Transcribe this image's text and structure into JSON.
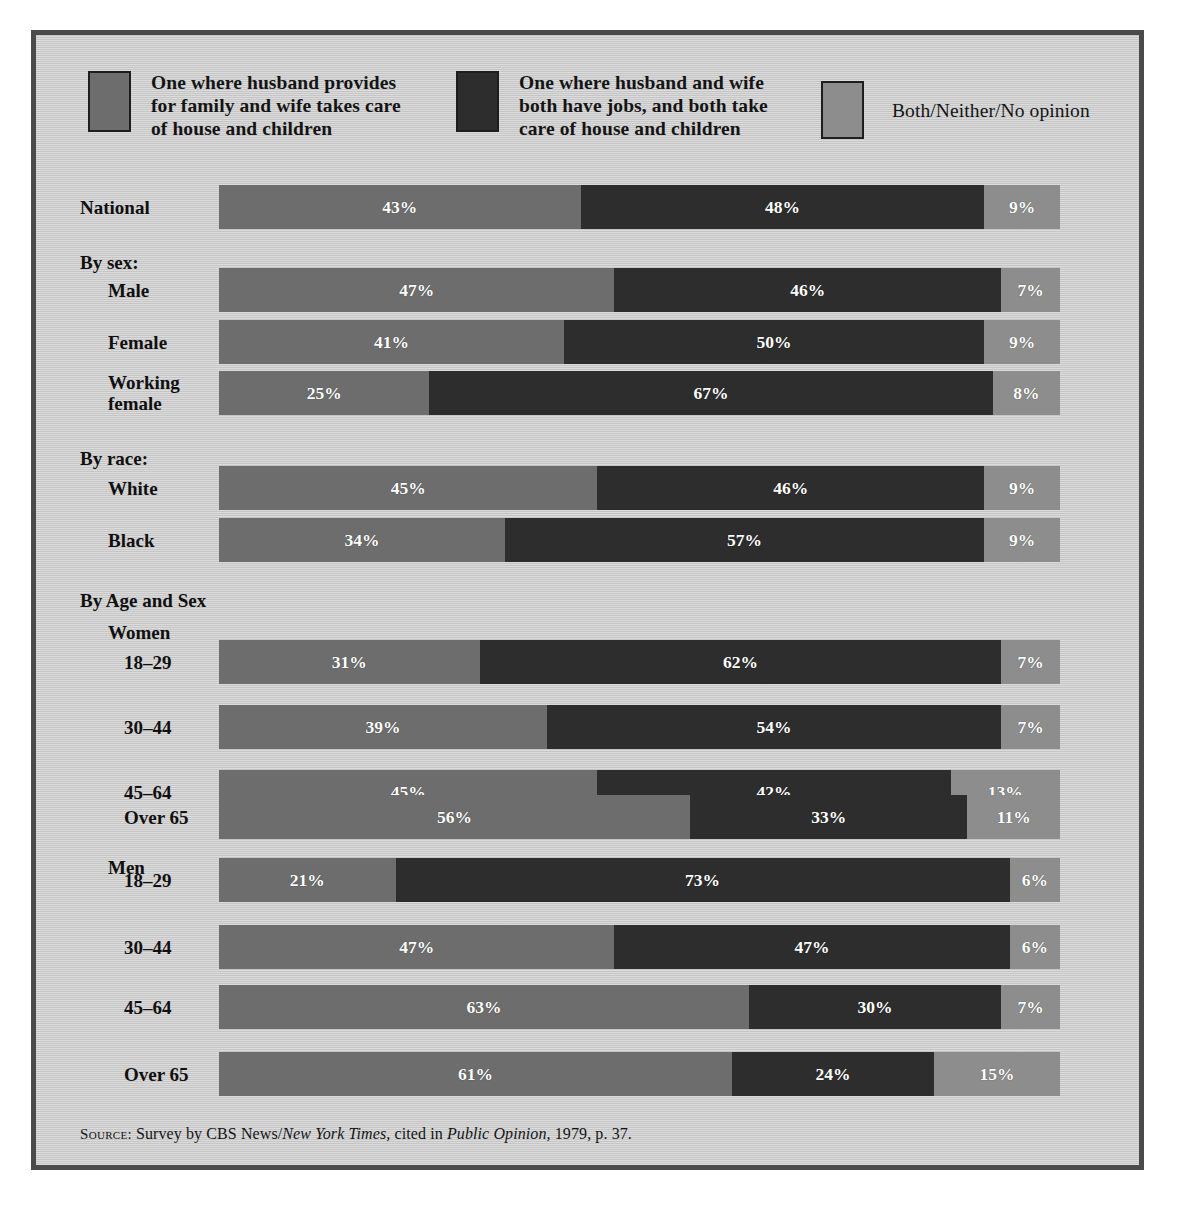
{
  "legend": {
    "items": [
      {
        "label": "One where husband provides\nfor family and wife takes care\nof house and children",
        "color": "#6d6d6d",
        "name": "husband-provides"
      },
      {
        "label": "One where husband and wife\nboth have jobs, and both take\ncare of house and children",
        "color": "#2d2d2d",
        "name": "both-have-jobs"
      },
      {
        "label": "Both/Neither/No opinion",
        "color": "#8d8d8d",
        "name": "both-neither-no-opinion"
      }
    ]
  },
  "source": {
    "prefix": "Source:",
    "text_1": " Survey by CBS News/",
    "italic_1": "New York Times,",
    "text_2": " cited in ",
    "italic_2": "Public Opinion,",
    "text_3": " 1979, p. 37."
  },
  "rows": [
    {
      "label": "National",
      "indent": 0,
      "type": "bar",
      "values": [
        43,
        48,
        9
      ],
      "labels": [
        "43%",
        "48%",
        "9%"
      ]
    },
    {
      "label": "By sex:",
      "indent": 0,
      "type": "heading",
      "values": [],
      "labels": []
    },
    {
      "label": "Male",
      "indent": 1,
      "type": "bar",
      "values": [
        47,
        46,
        7
      ],
      "labels": [
        "47%",
        "46%",
        "7%"
      ]
    },
    {
      "label": "Female",
      "indent": 1,
      "type": "bar",
      "values": [
        41,
        50,
        9
      ],
      "labels": [
        "41%",
        "50%",
        "9%"
      ]
    },
    {
      "label": "Working\nfemale",
      "indent": 1,
      "type": "bar",
      "values": [
        25,
        67,
        8
      ],
      "labels": [
        "25%",
        "67%",
        "8%"
      ]
    },
    {
      "label": "By race:",
      "indent": 0,
      "type": "heading",
      "values": [],
      "labels": []
    },
    {
      "label": "White",
      "indent": 1,
      "type": "bar",
      "values": [
        45,
        46,
        9
      ],
      "labels": [
        "45%",
        "46%",
        "9%"
      ]
    },
    {
      "label": "Black",
      "indent": 1,
      "type": "bar",
      "values": [
        34,
        57,
        9
      ],
      "labels": [
        "34%",
        "57%",
        "9%"
      ]
    },
    {
      "label": "By Age and Sex",
      "indent": 0,
      "type": "heading",
      "values": [],
      "labels": []
    },
    {
      "label": "Women",
      "indent": 1,
      "type": "heading",
      "values": [],
      "labels": []
    },
    {
      "label": "18–29",
      "indent": 2,
      "type": "bar",
      "values": [
        31,
        62,
        7
      ],
      "labels": [
        "31%",
        "62%",
        "7%"
      ]
    },
    {
      "label": "30–44",
      "indent": 2,
      "type": "bar",
      "values": [
        39,
        54,
        7
      ],
      "labels": [
        "39%",
        "54%",
        "7%"
      ]
    },
    {
      "label": "45–64",
      "indent": 2,
      "type": "bar",
      "values": [
        45,
        42,
        13
      ],
      "labels": [
        "45%",
        "42%",
        "13%"
      ]
    },
    {
      "label": "Over 65",
      "indent": 2,
      "type": "bar",
      "values": [
        56,
        33,
        11
      ],
      "labels": [
        "56%",
        "33%",
        "11%"
      ]
    },
    {
      "label": "Men",
      "indent": 1,
      "type": "heading",
      "values": [],
      "labels": []
    },
    {
      "label": "18–29",
      "indent": 2,
      "type": "bar",
      "values": [
        21,
        73,
        6
      ],
      "labels": [
        "21%",
        "73%",
        "6%"
      ]
    },
    {
      "label": "30–44",
      "indent": 2,
      "type": "bar",
      "values": [
        47,
        47,
        6
      ],
      "labels": [
        "47%",
        "47%",
        "6%"
      ]
    },
    {
      "label": "45–64",
      "indent": 2,
      "type": "bar",
      "values": [
        63,
        30,
        7
      ],
      "labels": [
        "63%",
        "30%",
        "7%"
      ]
    },
    {
      "label": "Over 65",
      "indent": 2,
      "type": "bar",
      "values": [
        61,
        24,
        15
      ],
      "labels": [
        "61%",
        "24%",
        "15%"
      ]
    }
  ],
  "chart_data": {
    "type": "bar",
    "subtype": "horizontal-stacked-100",
    "title": "",
    "xlabel": "",
    "ylabel": "",
    "xlim": [
      0,
      100
    ],
    "grid": false,
    "legend_position": "top",
    "categories": [
      "National",
      "Male",
      "Female",
      "Working female",
      "White",
      "Black",
      "Women 18–29",
      "Women 30–44",
      "Women 45–64",
      "Women Over 65",
      "Men 18–29",
      "Men 30–44",
      "Men 45–64",
      "Men Over 65"
    ],
    "group_headings": [
      "By sex:",
      "By race:",
      "By Age and Sex",
      "Women",
      "Men"
    ],
    "series": [
      {
        "name": "One where husband provides for family and wife takes care of house and children",
        "color": "#6d6d6d",
        "values": [
          43,
          47,
          41,
          25,
          45,
          34,
          31,
          39,
          45,
          56,
          21,
          47,
          63,
          61
        ]
      },
      {
        "name": "One where husband and wife both have jobs, and both take care of house and children",
        "color": "#2d2d2d",
        "values": [
          48,
          46,
          50,
          67,
          46,
          57,
          62,
          54,
          42,
          33,
          73,
          47,
          30,
          24
        ]
      },
      {
        "name": "Both/Neither/No opinion",
        "color": "#8d8d8d",
        "values": [
          9,
          7,
          9,
          8,
          9,
          9,
          7,
          7,
          13,
          11,
          6,
          6,
          7,
          15
        ]
      }
    ],
    "units": "percent",
    "annotations": [
      "Source: Survey by CBS News/New York Times, cited in Public Opinion, 1979, p. 37."
    ]
  }
}
